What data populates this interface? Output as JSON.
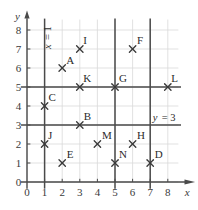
{
  "chart_data": {
    "type": "scatter",
    "title": "",
    "xlabel": "x",
    "ylabel": "y",
    "xlim": [
      0,
      8.6
    ],
    "ylim": [
      0,
      8.6
    ],
    "grid": true,
    "legend": "none",
    "xticks": [
      "0",
      "1",
      "2",
      "3",
      "4",
      "5",
      "6",
      "7",
      "8"
    ],
    "yticks": [
      "0",
      "1",
      "2",
      "3",
      "4",
      "5",
      "6",
      "7",
      "8"
    ],
    "points": [
      {
        "label": "A",
        "x": 2,
        "y": 6
      },
      {
        "label": "B",
        "x": 3,
        "y": 3
      },
      {
        "label": "C",
        "x": 1,
        "y": 4
      },
      {
        "label": "D",
        "x": 7,
        "y": 1
      },
      {
        "label": "E",
        "x": 2,
        "y": 1
      },
      {
        "label": "F",
        "x": 6,
        "y": 7
      },
      {
        "label": "G",
        "x": 5,
        "y": 5
      },
      {
        "label": "H",
        "x": 6,
        "y": 2
      },
      {
        "label": "I",
        "x": 3,
        "y": 7
      },
      {
        "label": "J",
        "x": 1,
        "y": 2
      },
      {
        "label": "K",
        "x": 3,
        "y": 5
      },
      {
        "label": "L",
        "x": 8,
        "y": 5
      },
      {
        "label": "M",
        "x": 4,
        "y": 2
      },
      {
        "label": "N",
        "x": 5,
        "y": 1
      }
    ],
    "vertical_lines": [
      {
        "x": 1,
        "label": "x = 1"
      },
      {
        "x": 5,
        "label": ""
      },
      {
        "x": 7,
        "label": ""
      }
    ],
    "horizontal_lines": [
      {
        "y": 3,
        "label": "y = 3"
      },
      {
        "y": 5,
        "label": ""
      }
    ],
    "annotations": [
      {
        "text": "x = 1",
        "orientation": "vertical"
      },
      {
        "text": "y = 3",
        "orientation": "horizontal"
      }
    ],
    "colors": {
      "grid": "#d9d9d9",
      "axis": "#4a4a4a",
      "line": "#4a4a4a",
      "marker": "#3a3a3a",
      "text": "#2b2b2b"
    }
  },
  "labels": {
    "x_axis": "x",
    "y_axis": "y",
    "vertical_line_label_var": "x",
    "vertical_line_label_eq": "=",
    "vertical_line_label_val": "1",
    "horizontal_line_label_var": "y",
    "horizontal_line_label_eq": "=",
    "horizontal_line_label_val": "3"
  },
  "ticks": {
    "x": [
      "0",
      "1",
      "2",
      "3",
      "4",
      "5",
      "6",
      "7",
      "8"
    ],
    "y": [
      "0",
      "1",
      "2",
      "3",
      "4",
      "5",
      "6",
      "7",
      "8"
    ]
  },
  "point_names": {
    "A": "A",
    "B": "B",
    "C": "C",
    "D": "D",
    "E": "E",
    "F": "F",
    "G": "G",
    "H": "H",
    "I": "I",
    "J": "J",
    "K": "K",
    "L": "L",
    "M": "M",
    "N": "N"
  }
}
